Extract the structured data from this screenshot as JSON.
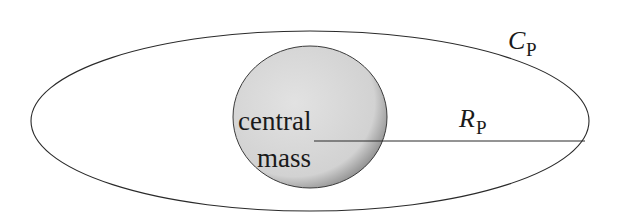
{
  "diagram": {
    "orbit_label": {
      "main": "C",
      "subscript": "P"
    },
    "radius_label": {
      "main": "R",
      "subscript": "P"
    },
    "central_body": {
      "line1": "central",
      "line2": "mass"
    },
    "colors": {
      "stroke": "#2a2a2a",
      "central_fill_light": "#e6e6e6",
      "central_fill_dark": "#9a9a9a",
      "background": "#ffffff"
    }
  }
}
